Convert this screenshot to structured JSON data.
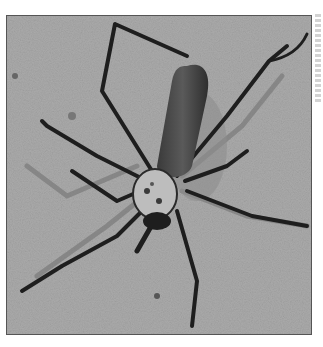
{
  "image": {
    "subject": "Large black spider with long segmented legs and a cylindrical abdomen on a grey speckled surface",
    "style": "grayscale photograph",
    "colors": {
      "background_surface": "#a9a9a9",
      "spider_body": "#2a2a2a",
      "abdomen": "#4a4a4a",
      "cephalothorax_pattern": "#cfcfcf",
      "frame_border": "#555555"
    }
  },
  "credit": {
    "orientation": "vertical",
    "text": ""
  }
}
